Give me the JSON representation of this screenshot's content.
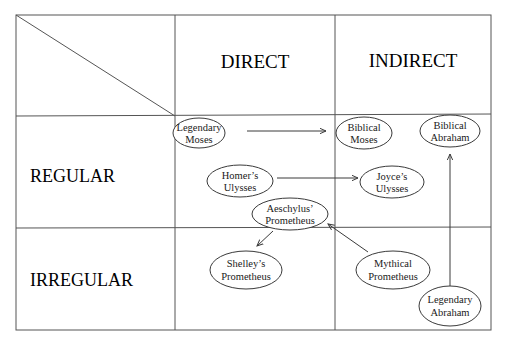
{
  "columns": [
    {
      "label": "DIRECT"
    },
    {
      "label": "INDIRECT"
    }
  ],
  "rows": [
    {
      "label": "REGULAR"
    },
    {
      "label": "IRREGULAR"
    }
  ],
  "nodes": {
    "legendary_moses": {
      "line1": "Legendary",
      "line2": "Moses"
    },
    "biblical_moses": {
      "line1": "Biblical",
      "line2": "Moses"
    },
    "biblical_abraham": {
      "line1": "Biblical",
      "line2": "Abraham"
    },
    "homers_ulysses": {
      "line1": "Homer’s",
      "line2": "Ulysses"
    },
    "joyces_ulysses": {
      "line1": "Joyce’s",
      "line2": "Ulysses"
    },
    "aeschylus_prometheus": {
      "line1": "Aeschylus’",
      "line2": "Prometheus"
    },
    "shelleys_prometheus": {
      "line1": "Shelley’s",
      "line2": "Prometheus"
    },
    "mythical_prometheus": {
      "line1": "Mythical",
      "line2": "Prometheus"
    },
    "legendary_abraham": {
      "line1": "Legendary",
      "line2": "Abraham"
    }
  },
  "edges": [
    {
      "from": "Legendary Moses",
      "to": "Biblical Moses"
    },
    {
      "from": "Homer’s Ulysses",
      "to": "Joyce’s Ulysses"
    },
    {
      "from": "Aeschylus’ Prometheus",
      "to": "Shelley’s Prometheus"
    },
    {
      "from": "Mythical Prometheus",
      "to": "Aeschylus’ Prometheus"
    },
    {
      "from": "Legendary Abraham",
      "to": "Biblical Abraham"
    }
  ],
  "colors": {
    "line": "#3a3a3a",
    "text": "#1a1a1a",
    "background": "#ffffff"
  }
}
